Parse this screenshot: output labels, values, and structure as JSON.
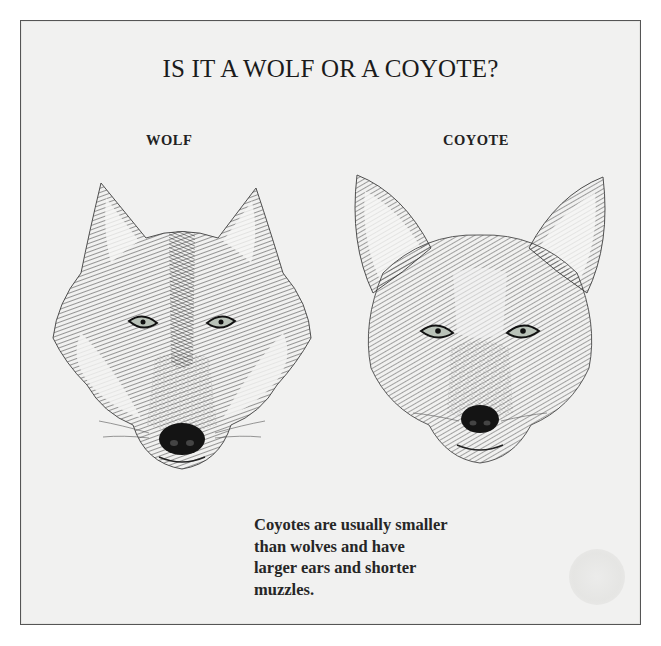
{
  "page": {
    "title": "IS IT A WOLF OR A COYOTE?",
    "labels": {
      "wolf": "WOLF",
      "coyote": "COYOTE"
    },
    "illustrations": [
      {
        "name": "wolf-head-illustration",
        "description": "pen-and-ink drawing of a wolf head, front view"
      },
      {
        "name": "coyote-head-illustration",
        "description": "pen-and-ink drawing of a coyote head, front view"
      }
    ],
    "caption_lines": [
      "Coyotes are usually smaller",
      "than wolves and have",
      "larger ears and shorter",
      "muzzles."
    ]
  },
  "colors": {
    "paper": "#f1f1f0",
    "ink": "#1a1a1a",
    "border": "#555555",
    "eye": "#b9c2b8"
  }
}
